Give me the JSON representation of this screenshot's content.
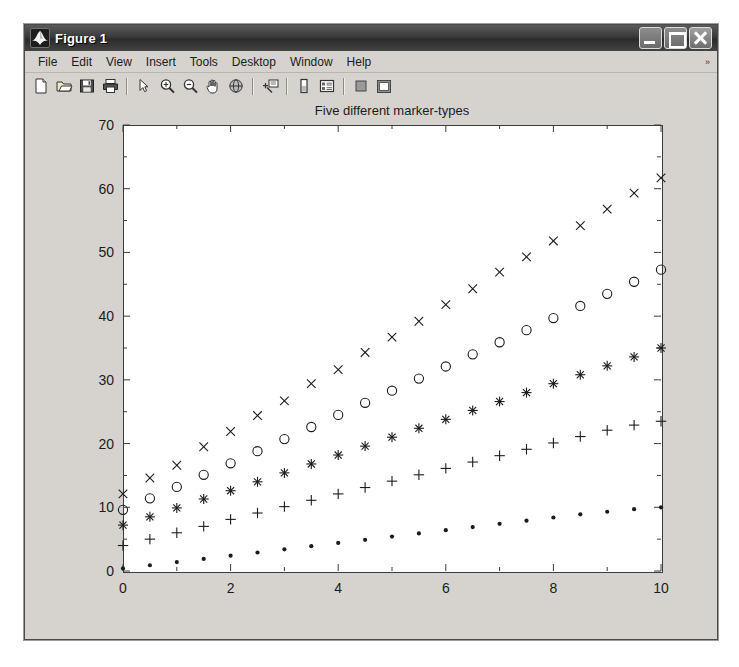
{
  "window": {
    "title": "Figure 1",
    "icon": "matlab-membrane-icon",
    "controls": {
      "minimize": "_",
      "maximize": "□",
      "close": "✕"
    }
  },
  "menubar": {
    "items": [
      {
        "label": "File"
      },
      {
        "label": "Edit"
      },
      {
        "label": "View"
      },
      {
        "label": "Insert"
      },
      {
        "label": "Tools"
      },
      {
        "label": "Desktop"
      },
      {
        "label": "Window"
      },
      {
        "label": "Help"
      }
    ],
    "overflow_marker": "»"
  },
  "toolbar": {
    "buttons": [
      {
        "name": "new-figure-icon"
      },
      {
        "name": "open-file-icon"
      },
      {
        "name": "save-figure-icon"
      },
      {
        "name": "print-figure-icon"
      },
      {
        "name": "separator"
      },
      {
        "name": "edit-plot-pointer-icon"
      },
      {
        "name": "zoom-in-icon"
      },
      {
        "name": "zoom-out-icon"
      },
      {
        "name": "pan-hand-icon"
      },
      {
        "name": "rotate-3d-icon"
      },
      {
        "name": "separator"
      },
      {
        "name": "data-cursor-icon"
      },
      {
        "name": "separator"
      },
      {
        "name": "insert-colorbar-icon"
      },
      {
        "name": "insert-legend-icon"
      },
      {
        "name": "separator"
      },
      {
        "name": "hide-plot-tools-icon"
      },
      {
        "name": "show-plot-tools-icon"
      }
    ]
  },
  "chart_data": {
    "type": "scatter",
    "title": "Five different marker-types",
    "xlabel": "",
    "ylabel": "",
    "xlim": [
      0,
      10
    ],
    "ylim": [
      0,
      70
    ],
    "xticks": [
      0,
      2,
      4,
      6,
      8,
      10
    ],
    "yticks": [
      0,
      10,
      20,
      30,
      40,
      50,
      60,
      70
    ],
    "grid": false,
    "legend": "none",
    "marker_color": "#1b1b1b",
    "x": [
      0,
      0.5,
      1,
      1.5,
      2,
      2.5,
      3,
      3.5,
      4,
      4.5,
      5,
      5.5,
      6,
      6.5,
      7,
      7.5,
      8,
      8.5,
      9,
      9.5,
      10
    ],
    "series": [
      {
        "name": "x-marker series",
        "marker": "x",
        "values": [
          12.1,
          14.6,
          16.6,
          19.5,
          21.9,
          24.4,
          26.7,
          29.4,
          31.6,
          34.3,
          36.7,
          39.2,
          41.8,
          44.3,
          46.9,
          49.3,
          51.8,
          54.2,
          56.8,
          59.3,
          61.7
        ]
      },
      {
        "name": "circle-marker series",
        "marker": "o",
        "values": [
          9.6,
          11.4,
          13.2,
          15.1,
          16.9,
          18.8,
          20.7,
          22.6,
          24.5,
          26.4,
          28.3,
          30.2,
          32.1,
          34.0,
          35.9,
          37.8,
          39.7,
          41.6,
          43.5,
          45.4,
          47.3
        ]
      },
      {
        "name": "star-marker series",
        "marker": "*",
        "values": [
          7.2,
          8.5,
          9.9,
          11.3,
          12.6,
          14.0,
          15.4,
          16.8,
          18.2,
          19.6,
          21.0,
          22.4,
          23.8,
          25.2,
          26.6,
          28.0,
          29.4,
          30.8,
          32.2,
          33.6,
          35.0
        ]
      },
      {
        "name": "plus-marker series",
        "marker": "+",
        "values": [
          4.0,
          5.0,
          6.0,
          7.0,
          8.1,
          9.1,
          10.1,
          11.1,
          12.1,
          13.1,
          14.1,
          15.1,
          16.1,
          17.1,
          18.1,
          19.1,
          20.1,
          21.1,
          22.1,
          22.9,
          23.5
        ]
      },
      {
        "name": "point-marker series",
        "marker": ".",
        "values": [
          0.4,
          0.9,
          1.4,
          1.9,
          2.4,
          2.9,
          3.4,
          3.9,
          4.4,
          4.9,
          5.4,
          5.9,
          6.4,
          6.9,
          7.4,
          7.9,
          8.4,
          8.9,
          9.3,
          9.7,
          10.0
        ]
      }
    ]
  }
}
